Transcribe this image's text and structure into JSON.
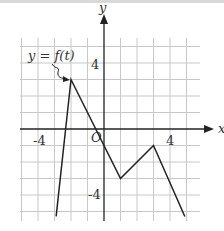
{
  "chart_data": {
    "type": "line",
    "title": "",
    "annotation": "y = f(t)",
    "xlabel": "x",
    "ylabel": "y",
    "origin_label": "O",
    "xlim": [
      -5,
      5
    ],
    "ylim": [
      -5.5,
      6
    ],
    "x_ticks": [
      {
        "value": -4,
        "label": "-4"
      },
      {
        "value": 4,
        "label": "4"
      }
    ],
    "y_ticks": [
      {
        "value": 4,
        "label": "4"
      },
      {
        "value": -4,
        "label": "-4"
      }
    ],
    "grid": true,
    "series": [
      {
        "name": "f(t)",
        "points": [
          [
            -2.9,
            -5.3
          ],
          [
            -2,
            3
          ],
          [
            1,
            -3
          ],
          [
            3,
            -1
          ],
          [
            4.9,
            -5.3
          ]
        ]
      }
    ]
  }
}
